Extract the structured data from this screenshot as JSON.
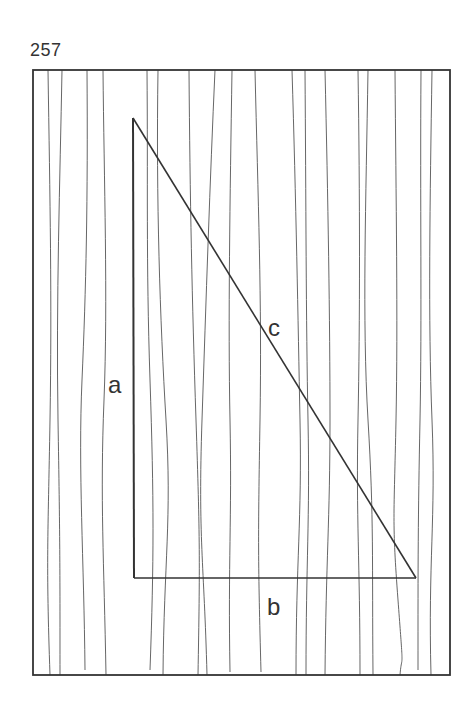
{
  "page": {
    "number": "257"
  },
  "diagram": {
    "type": "right-triangle-on-wood-grain",
    "frame": {
      "x": 33,
      "y": 70,
      "width": 417,
      "height": 605,
      "stroke": "#333333"
    },
    "triangle": {
      "vertices": {
        "top": [
          133,
          118
        ],
        "corner": [
          134,
          578
        ],
        "right": [
          416,
          578
        ]
      },
      "stroke": "#333333"
    },
    "labels": {
      "a": "a",
      "b": "b",
      "c": "c"
    },
    "grain_color": "#555555"
  }
}
